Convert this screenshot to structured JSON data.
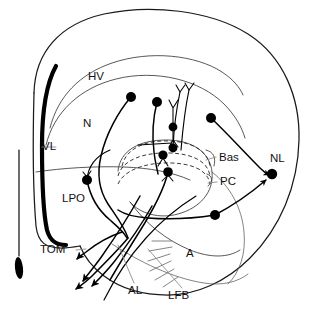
{
  "figure": {
    "width": 311,
    "height": 311,
    "background": "#ffffff"
  },
  "colors": {
    "outline": "#1a1a1a",
    "lamina": "#3a3a3a",
    "neuron": "#000000",
    "leader": "#8d8d8d",
    "hatch": "#767676",
    "label_text": "#111111"
  },
  "labels": [
    {
      "id": "HV",
      "text": "HV",
      "x": 88,
      "y": 77
    },
    {
      "id": "N",
      "text": "N",
      "x": 83,
      "y": 124
    },
    {
      "id": "VL",
      "text": "VL",
      "x": 42,
      "y": 147
    },
    {
      "id": "LPO",
      "text": "LPO",
      "x": 72,
      "y": 199
    },
    {
      "id": "TOM",
      "text": "TOM",
      "x": 54,
      "y": 250
    },
    {
      "id": "Bas",
      "text": "Bas",
      "x": 222,
      "y": 158
    },
    {
      "id": "PC",
      "text": "PC",
      "x": 223,
      "y": 182
    },
    {
      "id": "NL",
      "text": "NL",
      "x": 280,
      "y": 159
    },
    {
      "id": "A",
      "text": "A",
      "x": 189,
      "y": 254
    },
    {
      "id": "AL",
      "text": "AL",
      "x": 135,
      "y": 291
    },
    {
      "id": "LFB",
      "text": "LFB",
      "x": 177,
      "y": 296
    }
  ],
  "structures": {
    "outer_contour": "brain-outer-contour",
    "ventricle": "lateral-ventricle-VL",
    "laminae": [
      "HV-lamina",
      "N-lamina",
      "LPO-lamina",
      "Field-L-lamina"
    ],
    "dashed_band": "PC-Bas-lamina-band",
    "hatched_area": "archistriatum-hatching"
  },
  "neurons": [
    {
      "id": "n1",
      "soma_x": 131,
      "soma_y": 97,
      "type": "projection-neuron"
    },
    {
      "id": "n2",
      "soma_x": 157,
      "soma_y": 102,
      "type": "projection-neuron"
    },
    {
      "id": "n3",
      "soma_x": 173,
      "soma_y": 127,
      "type": "bitufted-neuron"
    },
    {
      "id": "n4",
      "soma_x": 173,
      "soma_y": 148,
      "type": "bitufted-neuron"
    },
    {
      "id": "n5",
      "soma_x": 163,
      "soma_y": 155,
      "type": "lamina-neuron"
    },
    {
      "id": "n6",
      "soma_x": 168,
      "soma_y": 172,
      "type": "lamina-neuron"
    },
    {
      "id": "n7",
      "soma_x": 87,
      "soma_y": 180,
      "type": "lpo-neuron"
    },
    {
      "id": "n8",
      "soma_x": 211,
      "soma_y": 118,
      "type": "nl-input-neuron"
    },
    {
      "id": "n9",
      "soma_x": 272,
      "soma_y": 174,
      "type": "NL-neuron"
    },
    {
      "id": "n10",
      "soma_x": 215,
      "soma_y": 215,
      "type": "archistriatal-neuron"
    }
  ],
  "arrows": {
    "count": 4,
    "targets": [
      "TOM-arrow",
      "AL-arrow-1",
      "AL-arrow-2",
      "AL-arrow-3"
    ]
  }
}
